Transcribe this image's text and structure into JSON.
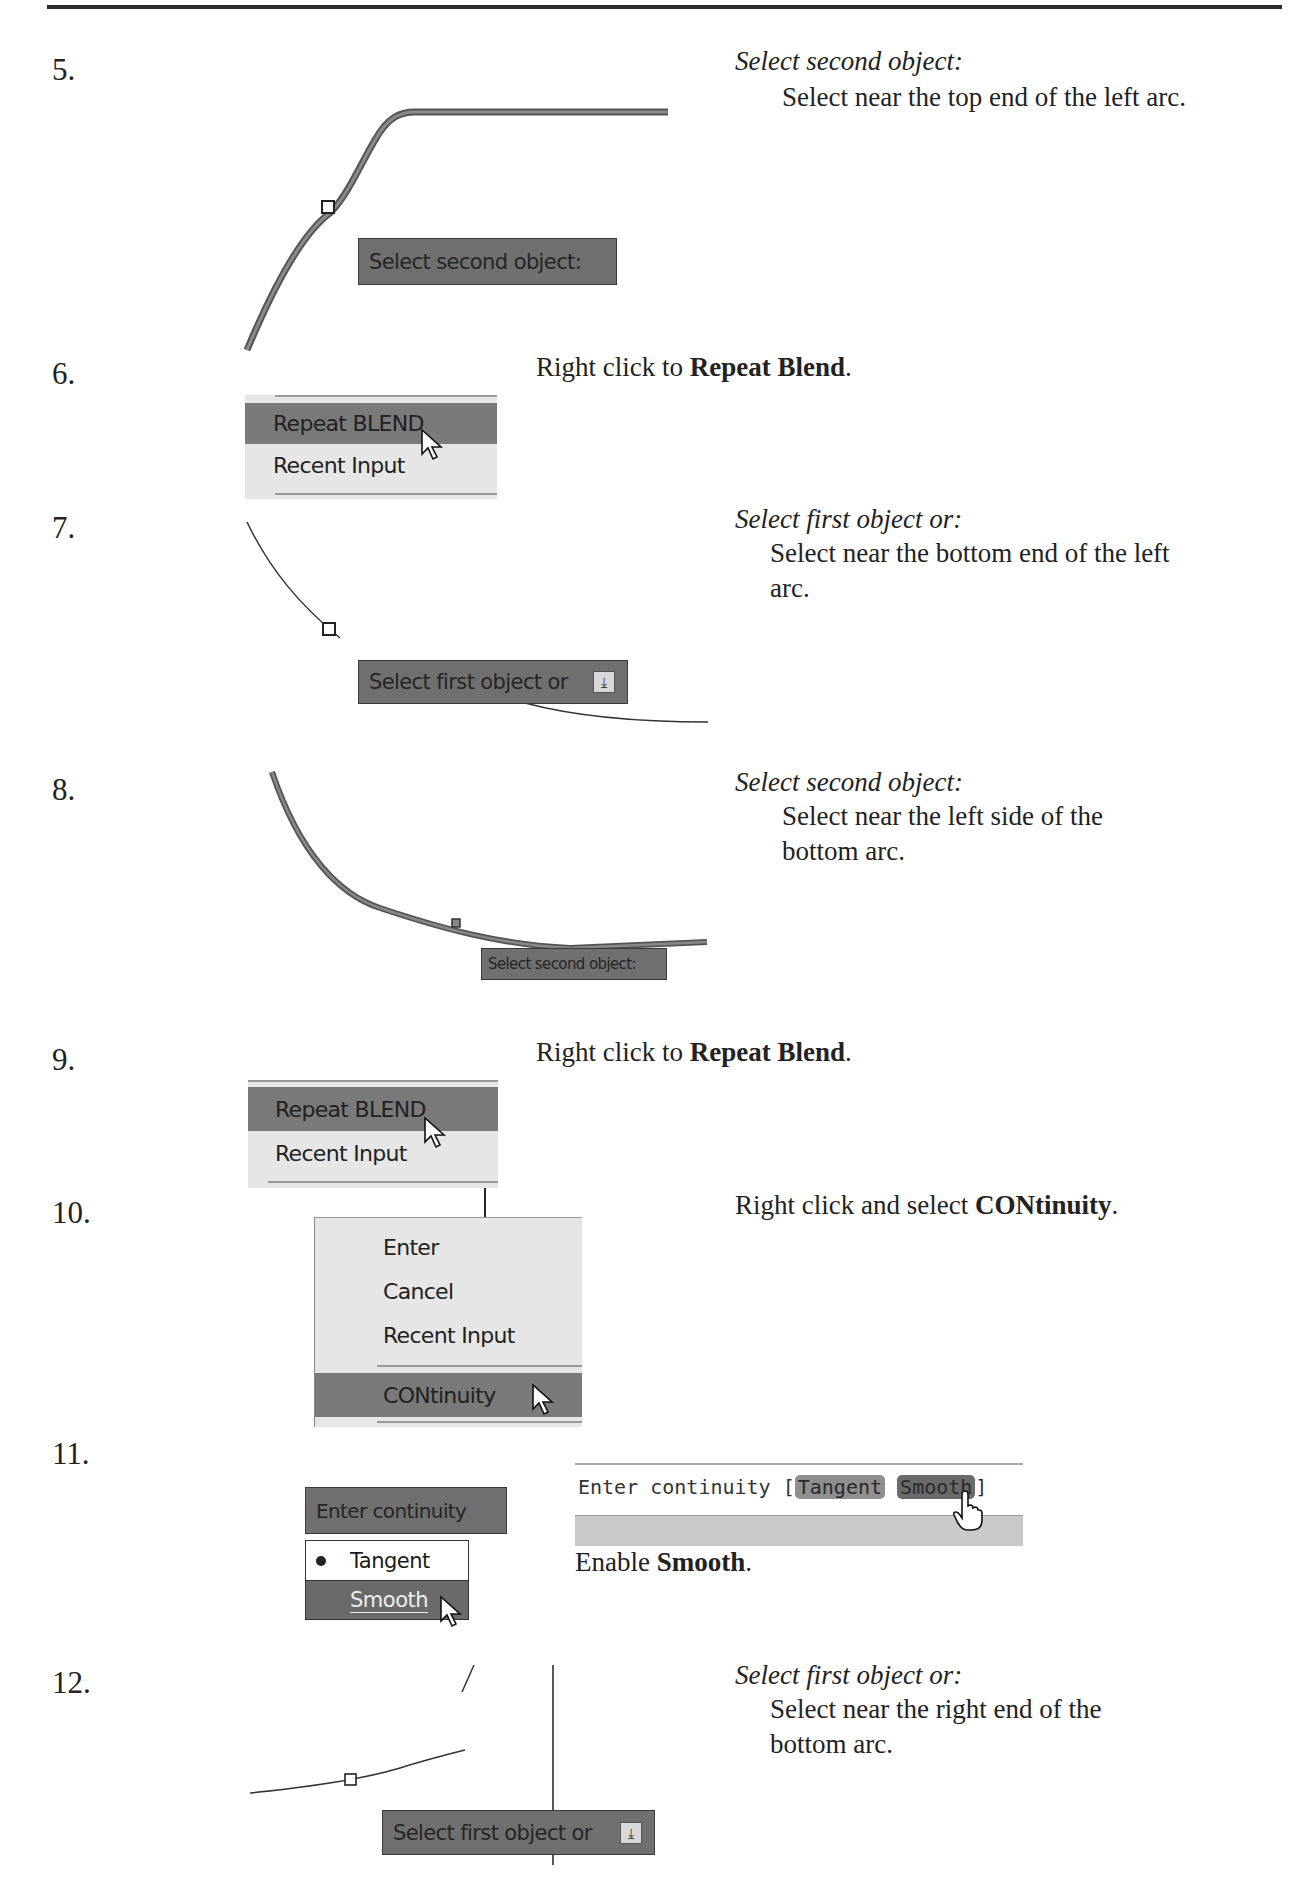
{
  "steps": [
    {
      "number": "5.",
      "instruction_title": "Select second object:",
      "instruction_body": "Select near the top end of the left arc.",
      "tooltip": "Select second object:"
    },
    {
      "number": "6.",
      "instruction_prefix": "Right click to ",
      "instruction_bold": "Repeat Blend",
      "instruction_suffix": ".",
      "menu_items": [
        "Repeat BLEND",
        "Recent Input"
      ],
      "highlighted_item": "Repeat BLEND"
    },
    {
      "number": "7.",
      "instruction_title": "Select first object or:",
      "instruction_body": "Select near the bottom end of the left arc.",
      "tooltip": "Select first object or",
      "tooltip_icon": "down-arrow-icon"
    },
    {
      "number": "8.",
      "instruction_title": "Select second object:",
      "instruction_body": "Select near the left side of the bottom arc.",
      "tooltip": "Select second object:"
    },
    {
      "number": "9.",
      "instruction_prefix": "Right click to ",
      "instruction_bold": "Repeat Blend",
      "instruction_suffix": ".",
      "menu_items": [
        "Repeat BLEND",
        "Recent Input"
      ],
      "highlighted_item": "Repeat BLEND"
    },
    {
      "number": "10.",
      "instruction_prefix": "Right click and select ",
      "instruction_bold": "CONtinuity",
      "instruction_suffix": ".",
      "menu_items": [
        "Enter",
        "Cancel",
        "Recent Input",
        "CONtinuity"
      ],
      "highlighted_item": "CONtinuity"
    },
    {
      "number": "11.",
      "tooltip": "Enter continuity",
      "options": [
        "Tangent",
        "Smooth"
      ],
      "selected_option": "Tangent",
      "hover_option": "Smooth",
      "command_line": {
        "prompt": "Enter continuity [",
        "options": [
          "Tangent",
          "Smooth"
        ],
        "close": "]"
      },
      "instruction_prefix": "Enable ",
      "instruction_bold": "Smooth",
      "instruction_suffix": "."
    },
    {
      "number": "12.",
      "instruction_title": "Select first object or:",
      "instruction_body": "Select near the right end of the bottom arc.",
      "tooltip": "Select first object or",
      "tooltip_icon": "down-arrow-icon"
    }
  ],
  "colors": {
    "tooltip_bg": "#707070",
    "menu_bg": "#e6e6e6",
    "menu_highlight": "#7a7a7a",
    "curve_gray": "#6e6e6e"
  }
}
